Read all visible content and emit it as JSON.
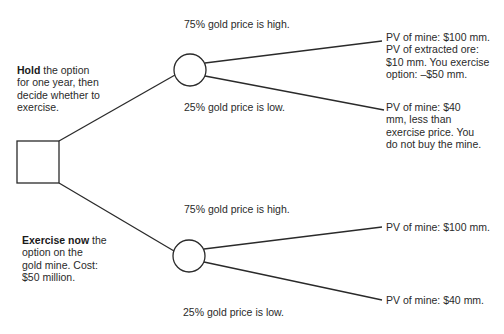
{
  "diagram": {
    "type": "decision-tree",
    "decision_node": {
      "shape": "square"
    },
    "branches": [
      {
        "id": "hold",
        "label_bold": "Hold",
        "label_lines": [
          " the option",
          "for one year, then",
          "decide whether to",
          "exercise."
        ],
        "chance_node": {
          "shape": "circle"
        },
        "outcomes": [
          {
            "probability_label": "75% gold price is high.",
            "result_lines": [
              "PV of mine: $100 mm.",
              "PV of extracted ore:",
              "$10 mm.  You exercise",
              "option: –$50 mm."
            ]
          },
          {
            "probability_label": "25% gold price is low.",
            "result_lines": [
              "PV of mine: $40",
              "mm, less than",
              "exercise price.  You",
              "do not buy the mine."
            ]
          }
        ]
      },
      {
        "id": "exercise-now",
        "label_bold": "Exercise now",
        "label_lines": [
          " the",
          "option on the",
          "gold mine. Cost:",
          "$50 million."
        ],
        "chance_node": {
          "shape": "circle"
        },
        "outcomes": [
          {
            "probability_label": "75% gold price is high.",
            "result_lines": [
              "PV of mine: $100 mm."
            ]
          },
          {
            "probability_label": "25% gold price is low.",
            "result_lines": [
              "PV of mine: $40 mm."
            ]
          }
        ]
      }
    ]
  },
  "colors": {
    "line": "#2a2a2a",
    "text": "#2a2a2a",
    "background": "#ffffff"
  }
}
